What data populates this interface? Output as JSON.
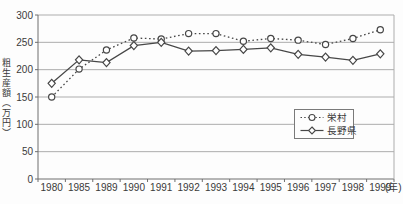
{
  "chart_data": {
    "type": "line",
    "title": "",
    "ylabel": "粗生産額（万円）",
    "x_unit_label": "(年)",
    "categories": [
      "1980",
      "1985",
      "1989",
      "1990",
      "1991",
      "1992",
      "1993",
      "1994",
      "1995",
      "1996",
      "1997",
      "1998",
      "1999"
    ],
    "ylim": [
      0,
      300
    ],
    "yticks": [
      0,
      50,
      100,
      150,
      200,
      250,
      300
    ],
    "grid": "horizontal",
    "legend_position": "inside-right",
    "series": [
      {
        "name": "栄村",
        "marker": "circle",
        "line": "dotted",
        "values": [
          150,
          201,
          236,
          258,
          256,
          266,
          266,
          252,
          257,
          254,
          246,
          257,
          273
        ]
      },
      {
        "name": "長野県",
        "marker": "diamond",
        "line": "solid",
        "values": [
          175,
          218,
          213,
          244,
          250,
          234,
          235,
          237,
          240,
          228,
          223,
          217,
          229
        ]
      }
    ],
    "colors": {
      "line": "#474747",
      "grid": "#adadad",
      "axis": "#6e6e6e",
      "text": "#3a3a3a",
      "background": "#fdfdfd",
      "marker_fill": "#ffffff",
      "legend_border": "#7a7a7a"
    }
  }
}
